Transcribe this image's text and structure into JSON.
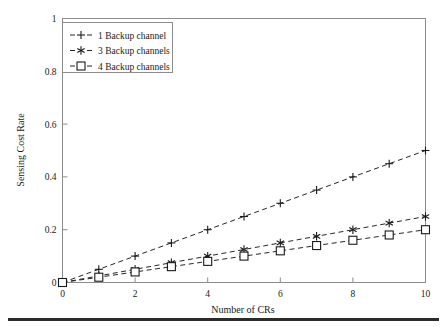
{
  "chart_data": {
    "type": "line",
    "title": "",
    "xlabel": "Number of CRs",
    "ylabel": "Sensing Cost Rate",
    "x": [
      0,
      1,
      2,
      3,
      4,
      5,
      6,
      7,
      8,
      9,
      10
    ],
    "xlim": [
      0,
      10
    ],
    "ylim": [
      0,
      1
    ],
    "xticks": [
      "0",
      "2",
      "4",
      "6",
      "8",
      "10"
    ],
    "xtick_values": [
      0,
      2,
      4,
      6,
      8,
      10
    ],
    "yticks": [
      "0",
      "0.2",
      "0.4",
      "0.6",
      "0.8",
      "1"
    ],
    "ytick_values": [
      0,
      0.2,
      0.4,
      0.6,
      0.8,
      1
    ],
    "grid": false,
    "legend_position": "top-left",
    "series": [
      {
        "name": "1 Backup channel",
        "marker": "plus",
        "linestyle": "dashed",
        "color": "#262626",
        "values": [
          0,
          0.05,
          0.1,
          0.15,
          0.2,
          0.25,
          0.3,
          0.35,
          0.4,
          0.45,
          0.5
        ]
      },
      {
        "name": "3 Backup channels",
        "marker": "asterisk",
        "linestyle": "dashed",
        "color": "#262626",
        "values": [
          0,
          0.025,
          0.05,
          0.075,
          0.1,
          0.125,
          0.15,
          0.175,
          0.2,
          0.225,
          0.25
        ]
      },
      {
        "name": "4 Backup channels",
        "marker": "square",
        "linestyle": "dashed",
        "color": "#262626",
        "values": [
          0,
          0.02,
          0.04,
          0.06,
          0.08,
          0.1,
          0.12,
          0.14,
          0.16,
          0.18,
          0.2
        ]
      }
    ]
  },
  "legend": {
    "entries": [
      {
        "label": "1 Backup channel"
      },
      {
        "label": "3 Backup channels"
      },
      {
        "label": "4 Backup channels"
      }
    ]
  },
  "axes": {
    "x_title": "Number of CRs",
    "y_title": "Sensing Cost Rate"
  }
}
